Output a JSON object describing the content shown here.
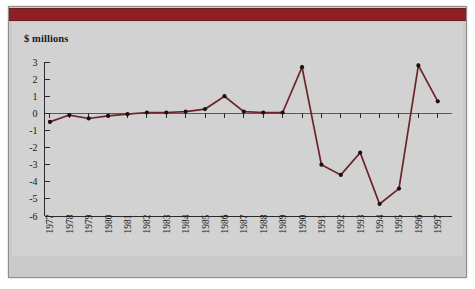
{
  "figure": {
    "unit_label": "$ millions",
    "header_bar_color": "#8d2024",
    "line_color": "#6d2329",
    "marker_color": "#1a1010",
    "panel_background": "#c9c9c9",
    "plot_background": "#d2d2d2"
  },
  "chart_data": {
    "type": "line",
    "title": "",
    "subtitle": "",
    "xlabel": "",
    "ylabel": "$ millions",
    "ylim": [
      -6,
      3
    ],
    "yticks": [
      3,
      2,
      1,
      0,
      -1,
      -2,
      -3,
      -4,
      -5,
      -6
    ],
    "ytick_labels": [
      "3",
      "2",
      "1",
      "0",
      "-1",
      "-2",
      "-3",
      "-4",
      "-5",
      "-6"
    ],
    "grid": false,
    "legend": false,
    "categories": [
      "1977",
      "1978",
      "1979",
      "1980",
      "1981",
      "1982",
      "1983",
      "1984",
      "1985",
      "1986",
      "1987",
      "1988",
      "1989",
      "1990",
      "1991",
      "1992",
      "1993",
      "1994",
      "1995",
      "1996",
      "1997"
    ],
    "values": [
      -0.5,
      -0.1,
      -0.3,
      -0.15,
      -0.05,
      0.05,
      0.05,
      0.1,
      0.25,
      1.0,
      0.1,
      0.05,
      0.05,
      2.7,
      -3.0,
      -3.6,
      -2.3,
      -5.3,
      -4.4,
      2.8,
      0.7
    ],
    "series": [
      {
        "name": "",
        "values": [
          -0.5,
          -0.1,
          -0.3,
          -0.15,
          -0.05,
          0.05,
          0.05,
          0.1,
          0.25,
          1.0,
          0.1,
          0.05,
          0.05,
          2.7,
          -3.0,
          -3.6,
          -2.3,
          -5.3,
          -4.4,
          2.8,
          0.7
        ]
      }
    ]
  }
}
